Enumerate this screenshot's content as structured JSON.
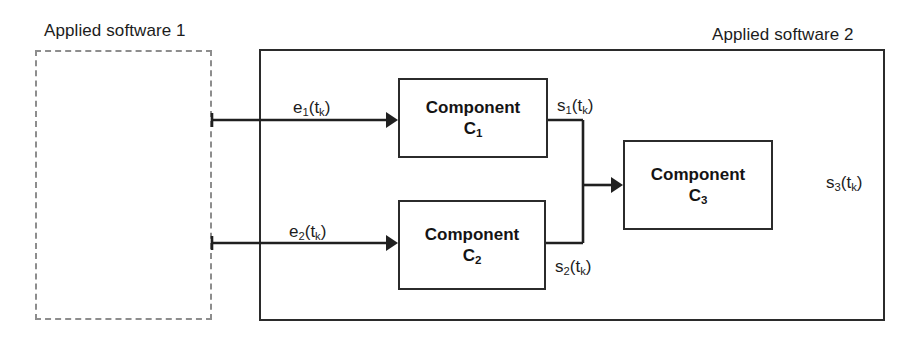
{
  "diagram": {
    "background_color": "#ffffff",
    "line_color": "#202020",
    "dashed_border_color": "#8d8d8d",
    "solid_border_color": "#2b2b2b",
    "boundaries": [
      {
        "id": "software1",
        "label": "Applied software 1",
        "style": "dashed"
      },
      {
        "id": "software2",
        "label": "Applied software 2",
        "style": "solid"
      }
    ],
    "components": [
      {
        "id": "c1",
        "title": "Component",
        "name": "C",
        "index": "1"
      },
      {
        "id": "c2",
        "title": "Component",
        "name": "C",
        "index": "2"
      },
      {
        "id": "c3",
        "title": "Component",
        "name": "C",
        "index": "3"
      }
    ],
    "signals": [
      {
        "id": "e1",
        "base": "e",
        "index": "1",
        "arg": "(t",
        "argindex": "k",
        "argclose": ")",
        "from": "software1",
        "to": "c1"
      },
      {
        "id": "e2",
        "base": "e",
        "index": "2",
        "arg": "(t",
        "argindex": "k",
        "argclose": ")",
        "from": "software1",
        "to": "c2"
      },
      {
        "id": "s1",
        "base": "s",
        "index": "1",
        "arg": "(t",
        "argindex": "k",
        "argclose": ")",
        "from": "c1",
        "to": "c3"
      },
      {
        "id": "s2",
        "base": "s",
        "index": "2",
        "arg": "(t",
        "argindex": "k",
        "argclose": ")",
        "from": "c2",
        "to": "c3"
      },
      {
        "id": "s3",
        "base": "s",
        "index": "3",
        "arg": "(t",
        "argindex": "k",
        "argclose": ")",
        "from": "c3",
        "to": "output"
      }
    ]
  }
}
